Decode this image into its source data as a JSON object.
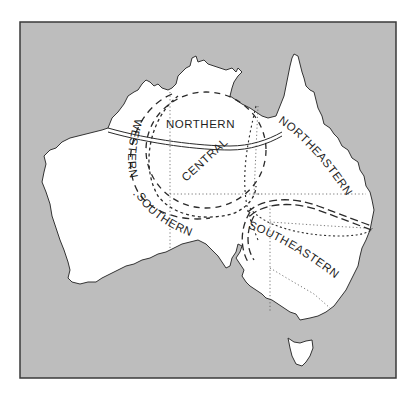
{
  "map": {
    "title": "Australia regions",
    "colors": {
      "sea": "#bdbdbd",
      "land": "#ffffff",
      "frame": "#3a3a3a",
      "lines": "#2a2a2a",
      "text": "#1f1f1f"
    },
    "regions": [
      {
        "id": "northern",
        "label": "NORTHERN"
      },
      {
        "id": "central",
        "label": "CENTRAL"
      },
      {
        "id": "northeastern",
        "label": "NORTHEASTERN"
      },
      {
        "id": "western",
        "label": "WESTERN"
      },
      {
        "id": "southern",
        "label": "SOUTHERN"
      },
      {
        "id": "southeastern",
        "label": "SOUTHEASTERN"
      }
    ],
    "separator": "·"
  }
}
